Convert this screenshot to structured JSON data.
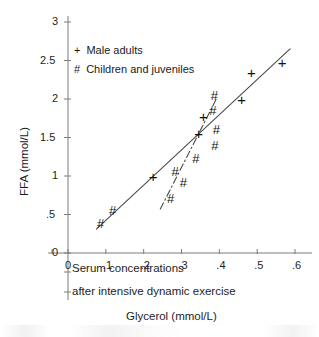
{
  "chart_data": {
    "type": "scatter",
    "title": "",
    "xlabel": "Glycerol (mmol/L)",
    "ylabel": "FFA (mmol/L)",
    "xlim": [
      0,
      0.6
    ],
    "ylim": [
      0,
      3
    ],
    "xticks": [
      "0",
      ".1",
      ".2",
      ".3",
      ".4",
      ".5",
      ".6"
    ],
    "xtick_values": [
      0,
      0.1,
      0.2,
      0.3,
      0.4,
      0.5,
      0.6
    ],
    "yticks": [
      "0",
      ".5",
      "1",
      "1.5",
      "2",
      "2.5",
      "3"
    ],
    "ytick_values": [
      0,
      0.5,
      1,
      1.5,
      2,
      2.5,
      3
    ],
    "grid": false,
    "legend_position": "upper-left-inside",
    "series": [
      {
        "name": "Male adults",
        "marker": "+",
        "legend_symbol": "+",
        "points": [
          {
            "x": 0.225,
            "y": 0.99
          },
          {
            "x": 0.345,
            "y": 1.55
          },
          {
            "x": 0.358,
            "y": 1.76
          },
          {
            "x": 0.459,
            "y": 1.99
          },
          {
            "x": 0.485,
            "y": 2.34
          },
          {
            "x": 0.566,
            "y": 2.47
          }
        ]
      },
      {
        "name": "Children and juveniles",
        "marker": "#",
        "legend_symbol": "#",
        "points": [
          {
            "x": 0.086,
            "y": 0.38
          },
          {
            "x": 0.118,
            "y": 0.55
          },
          {
            "x": 0.271,
            "y": 0.7
          },
          {
            "x": 0.283,
            "y": 1.05
          },
          {
            "x": 0.305,
            "y": 0.91
          },
          {
            "x": 0.338,
            "y": 1.22
          },
          {
            "x": 0.388,
            "y": 1.39
          },
          {
            "x": 0.392,
            "y": 1.6
          },
          {
            "x": 0.383,
            "y": 1.84
          },
          {
            "x": 0.387,
            "y": 2.04
          }
        ]
      }
    ],
    "lines": [
      {
        "name": "male-adults-regression",
        "style": "solid",
        "from": {
          "x": 0.075,
          "y": 0.31
        },
        "to": {
          "x": 0.587,
          "y": 2.65
        }
      },
      {
        "name": "children-juveniles-regression",
        "style": "dash-dot",
        "from": {
          "x": 0.244,
          "y": 0.57
        },
        "to": {
          "x": 0.393,
          "y": 2.01
        }
      }
    ],
    "annotations": [
      "Serum concentrations",
      "after intensive dynamic exercise"
    ]
  },
  "legend": {
    "items": [
      {
        "symbol": "+",
        "label": "Male adults"
      },
      {
        "symbol": "#",
        "label": "Children and juveniles"
      }
    ]
  },
  "axes": {
    "x_title": "Glycerol (mmol/L)",
    "y_title": "FFA (mmol/L)",
    "x_ticks": [
      "0",
      ".1",
      ".2",
      ".3",
      ".4",
      ".5",
      ".6"
    ],
    "y_ticks": [
      "0",
      ".5",
      "1",
      "1.5",
      "2",
      "2.5",
      "3"
    ]
  },
  "captions": {
    "line1": "Serum concentrations",
    "line2": "after intensive dynamic exercise",
    "line3": "Glycerol (mmol/L)"
  },
  "colors": {
    "ink": "#1e1e1e",
    "axis": "#7d7d7d",
    "background": "#ffffff"
  }
}
